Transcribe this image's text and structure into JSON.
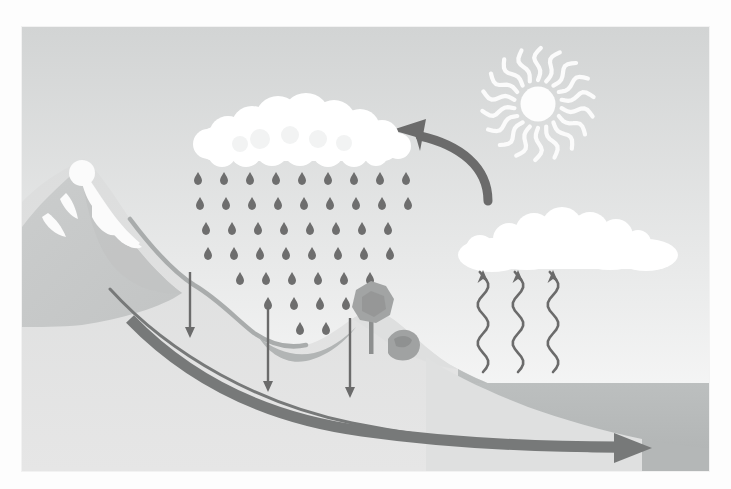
{
  "figure": {
    "style": "flat-grayscale-illustration",
    "frame": {
      "x": 22,
      "y": 27,
      "width": 687,
      "height": 444
    }
  },
  "palette": {
    "page_background": "#fdfdfd",
    "sky_top": "#d4d6d6",
    "sky_bottom": "#fbfbfb",
    "land_light": "#e3e3e3",
    "land_mid": "#d2d4d4",
    "mountain": "#c9cbcb",
    "mountain_shade": "#bcbfbf",
    "snow": "#fbfbfb",
    "water_body": "#b9bcbc",
    "water_dark": "#a8abab",
    "cloud": "#ffffff",
    "cloud_shadow": "#efefef",
    "raindrop": "#6e6e6e",
    "arrow_dark": "#6b6b6b",
    "arrow_thick": "#777979",
    "tree_canopy": "#9a9c9c",
    "tree_trunk": "#8d8f8f",
    "sun": "#fdfdfd"
  },
  "elements": {
    "sun": {
      "name": "Sun",
      "label": "sun",
      "cx": 538,
      "cy": 104,
      "radius": 17,
      "ray_count": 18,
      "ray_style": "wavy"
    },
    "rain_cloud": {
      "name": "Rain cloud (precipitation source)",
      "label": "rain-cloud",
      "x": 190,
      "y": 95,
      "width": 210,
      "height": 62,
      "puff_count": 22
    },
    "right_cloud": {
      "name": "Condensation cloud",
      "label": "condensation-cloud",
      "x": 444,
      "y": 192,
      "width": 224,
      "height": 62,
      "puff_count": 16
    },
    "rain": {
      "name": "Rainfall",
      "label": "precipitation",
      "drop_count": 58,
      "drop_color": "#6e6e6e",
      "rows": 9,
      "columns": 8
    },
    "mountain": {
      "name": "Snow-capped mountain",
      "label": "mountain",
      "peak_x": 80,
      "peak_y": 160,
      "snowline": "white streaks down the upper slopes"
    },
    "lake": {
      "name": "Valley lake",
      "label": "surface-water-lake",
      "x": 245,
      "y": 318,
      "width": 98,
      "height": 22
    },
    "ocean": {
      "name": "Ocean / large water body",
      "label": "ocean",
      "surface_y": 385
    },
    "tree": {
      "name": "Tree on hillside",
      "label": "tree",
      "cx": 350,
      "cy": 285
    },
    "bush": {
      "name": "Shrub behind tree",
      "label": "bush",
      "cx": 378,
      "cy": 322
    },
    "curved_arrow": {
      "name": "Cloud transport arrow",
      "label": "advection-arrow",
      "direction": "right-to-left",
      "color": "#6b6b6b"
    },
    "evaporation_arrows": {
      "name": "Evaporation arrows",
      "label": "evaporation-arrows",
      "count": 3,
      "direction": "up",
      "style": "wavy",
      "x_positions": [
        483,
        518,
        553
      ],
      "base_y": 372,
      "tip_y": 272
    },
    "infiltration_arrows": {
      "name": "Infiltration arrows",
      "label": "infiltration-arrows",
      "count": 3,
      "direction": "down",
      "style": "straight",
      "x_positions": [
        190,
        268,
        350
      ],
      "tops": [
        272,
        307,
        318
      ],
      "tips": [
        338,
        392,
        398
      ]
    },
    "groundwater_arrow": {
      "name": "Groundwater flow arrow",
      "label": "groundwater-flow-arrow",
      "direction": "left-to-right",
      "start": [
        110,
        290
      ],
      "end": [
        625,
        424
      ],
      "color": "#777979"
    },
    "river": {
      "name": "Runoff stream down mountain slope",
      "label": "runoff-stream",
      "color": "#a9acac"
    }
  },
  "process_labels": {
    "evaporation": "evaporation",
    "condensation": "condensation",
    "precipitation": "precipitation",
    "infiltration": "infiltration",
    "runoff": "runoff",
    "groundwater_flow": "groundwater flow"
  }
}
